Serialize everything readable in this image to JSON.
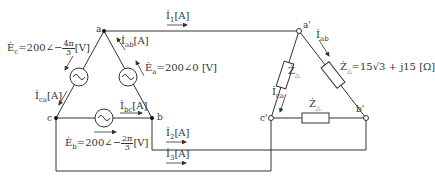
{
  "diagram": {
    "type": "three-phase delta-delta circuit",
    "colors": {
      "wire": "#333333",
      "background": "#ffffff"
    },
    "nodes": {
      "a": "a",
      "b": "b",
      "c": "c",
      "a_prime": "a'",
      "b_prime": "b'",
      "c_prime": "c'"
    },
    "sources": {
      "Ea": {
        "label": "Ė_a = 200∠0 [V]",
        "prefix": "Ė",
        "sub": "a",
        "text": "=200∠0 [V]"
      },
      "Eb": {
        "label": "Ė_b = 200∠−2π/3 [V]",
        "prefix": "Ė",
        "sub": "b",
        "text": "=200∠−",
        "num": "2π",
        "den": "3",
        "unit": "[V]"
      },
      "Ec": {
        "label": "Ė_c = 200∠−4π/3 [V]",
        "prefix": "Ė",
        "sub": "c",
        "text": "=200∠−",
        "num": "4π",
        "den": "3",
        "unit": "[V]"
      }
    },
    "currents": {
      "Iab": {
        "prefix": "İ",
        "sub": "ab",
        "unit": "[A]"
      },
      "Ibc": {
        "prefix": "İ",
        "sub": "bc",
        "unit": "[A]"
      },
      "Ica": {
        "prefix": "İ",
        "sub": "ca",
        "unit": "[A]"
      },
      "I1": {
        "prefix": "İ",
        "sub": "1",
        "unit": "[A]"
      },
      "I2": {
        "prefix": "İ",
        "sub": "2",
        "unit": "[A]"
      },
      "I3": {
        "prefix": "İ",
        "sub": "3",
        "unit": "[A]"
      },
      "Iab_load": {
        "prefix": "İ",
        "sub": "ab",
        "unit": ""
      },
      "Ica_load": {
        "prefix": "İ",
        "sub": "ca",
        "unit": ""
      }
    },
    "impedance": {
      "symbol": "Ż",
      "sub": "△",
      "value_text": "=15√3 + j15 [Ω]"
    }
  }
}
